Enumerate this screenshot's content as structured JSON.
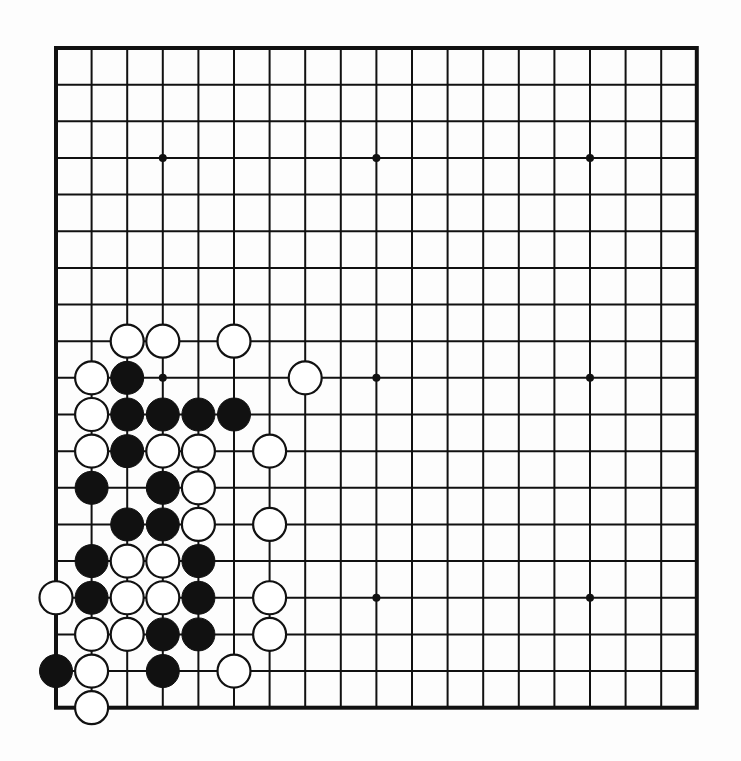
{
  "board": {
    "size": 19,
    "origin_x": 56,
    "origin_y": 48,
    "spacing_x": 35.6,
    "spacing_y": 36.65,
    "stone_radius": 16.5,
    "colors": {
      "line": "#111111",
      "black_stone": "#111111",
      "white_stone": "#ffffff",
      "background": "#fdfdfd"
    },
    "star_points": [
      [
        3,
        3
      ],
      [
        9,
        3
      ],
      [
        15,
        3
      ],
      [
        3,
        9
      ],
      [
        9,
        9
      ],
      [
        15,
        9
      ],
      [
        3,
        15
      ],
      [
        9,
        15
      ],
      [
        15,
        15
      ]
    ],
    "stones": [
      {
        "color": "white",
        "col": 2,
        "row": 8
      },
      {
        "color": "white",
        "col": 3,
        "row": 8
      },
      {
        "color": "white",
        "col": 5,
        "row": 8
      },
      {
        "color": "white",
        "col": 1,
        "row": 9
      },
      {
        "color": "black",
        "col": 2,
        "row": 9
      },
      {
        "color": "white",
        "col": 7,
        "row": 9
      },
      {
        "color": "white",
        "col": 1,
        "row": 10
      },
      {
        "color": "black",
        "col": 2,
        "row": 10
      },
      {
        "color": "black",
        "col": 3,
        "row": 10
      },
      {
        "color": "black",
        "col": 4,
        "row": 10
      },
      {
        "color": "black",
        "col": 5,
        "row": 10
      },
      {
        "color": "white",
        "col": 1,
        "row": 11
      },
      {
        "color": "black",
        "col": 2,
        "row": 11
      },
      {
        "color": "white",
        "col": 3,
        "row": 11
      },
      {
        "color": "white",
        "col": 4,
        "row": 11
      },
      {
        "color": "white",
        "col": 6,
        "row": 11
      },
      {
        "color": "black",
        "col": 1,
        "row": 12
      },
      {
        "color": "black",
        "col": 3,
        "row": 12
      },
      {
        "color": "white",
        "col": 4,
        "row": 12
      },
      {
        "color": "black",
        "col": 2,
        "row": 13
      },
      {
        "color": "black",
        "col": 3,
        "row": 13
      },
      {
        "color": "white",
        "col": 4,
        "row": 13
      },
      {
        "color": "white",
        "col": 6,
        "row": 13
      },
      {
        "color": "black",
        "col": 1,
        "row": 14
      },
      {
        "color": "white",
        "col": 2,
        "row": 14
      },
      {
        "color": "white",
        "col": 3,
        "row": 14
      },
      {
        "color": "black",
        "col": 4,
        "row": 14
      },
      {
        "color": "white",
        "col": 0,
        "row": 15
      },
      {
        "color": "black",
        "col": 1,
        "row": 15
      },
      {
        "color": "white",
        "col": 2,
        "row": 15
      },
      {
        "color": "white",
        "col": 3,
        "row": 15
      },
      {
        "color": "black",
        "col": 4,
        "row": 15
      },
      {
        "color": "white",
        "col": 6,
        "row": 15
      },
      {
        "color": "white",
        "col": 1,
        "row": 16
      },
      {
        "color": "white",
        "col": 2,
        "row": 16
      },
      {
        "color": "black",
        "col": 3,
        "row": 16
      },
      {
        "color": "black",
        "col": 4,
        "row": 16
      },
      {
        "color": "white",
        "col": 6,
        "row": 16
      },
      {
        "color": "black",
        "col": 0,
        "row": 17
      },
      {
        "color": "white",
        "col": 1,
        "row": 17
      },
      {
        "color": "black",
        "col": 3,
        "row": 17
      },
      {
        "color": "white",
        "col": 5,
        "row": 17
      },
      {
        "color": "white",
        "col": 1,
        "row": 18
      }
    ]
  }
}
